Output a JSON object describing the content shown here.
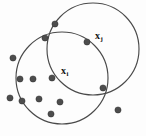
{
  "figure": {
    "type": "scatter-with-neighborhood-circles",
    "background_color": "#fdfdfd",
    "stroke_color": "#4a4a4a",
    "point_color": "#4d4d4d",
    "width": 146,
    "height": 136
  },
  "labels": {
    "xi": {
      "base": "x",
      "subscript": "i",
      "x": 61,
      "y": 66
    },
    "xj": {
      "base": "x",
      "subscript": "j",
      "x": 95,
      "y": 31
    }
  },
  "chart_data": {
    "type": "scatter",
    "title": "",
    "xlabel": "",
    "ylabel": "",
    "grid": false,
    "legend": "none",
    "xlim": [
      0,
      146
    ],
    "ylim": [
      0,
      136
    ],
    "circles": [
      {
        "name": "neighborhood-xi",
        "cx": 62,
        "cy": 78,
        "r": 46
      },
      {
        "name": "neighborhood-xj",
        "cx": 93,
        "cy": 49,
        "r": 46
      }
    ],
    "points": [
      {
        "name": "point-01",
        "x": 55,
        "y": 24
      },
      {
        "name": "point-02",
        "x": 45,
        "y": 38
      },
      {
        "name": "point-03",
        "x": 87,
        "y": 42
      },
      {
        "name": "point-04",
        "x": 13,
        "y": 58
      },
      {
        "name": "point-05",
        "x": 52,
        "y": 78
      },
      {
        "name": "point-06",
        "x": 20,
        "y": 79
      },
      {
        "name": "point-07",
        "x": 33,
        "y": 79
      },
      {
        "name": "point-08",
        "x": 10,
        "y": 98
      },
      {
        "name": "point-09",
        "x": 22,
        "y": 101
      },
      {
        "name": "point-10",
        "x": 39,
        "y": 99
      },
      {
        "name": "point-11",
        "x": 60,
        "y": 102
      },
      {
        "name": "point-12",
        "x": 51,
        "y": 114
      },
      {
        "name": "point-13",
        "x": 103,
        "y": 88
      },
      {
        "name": "point-14",
        "x": 118,
        "y": 110
      }
    ]
  }
}
